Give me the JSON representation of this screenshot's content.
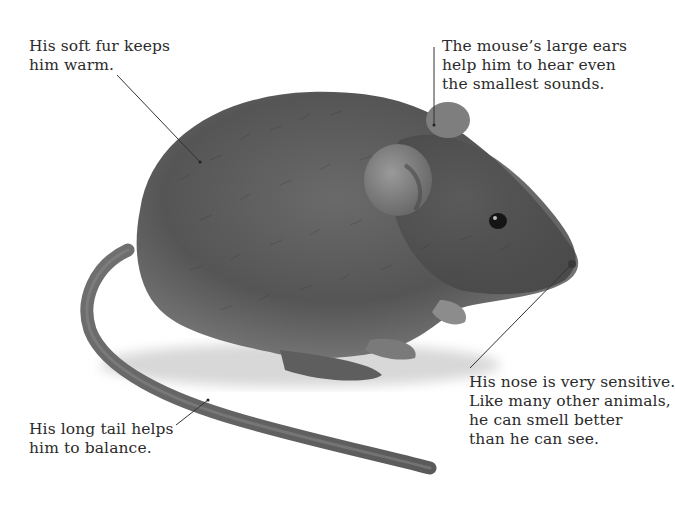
{
  "image": {
    "subject": "mouse",
    "background_color": "#ffffff",
    "fur_color": "#5e5e5e",
    "tail_color": "#6f6f6f",
    "text_color": "#2b2b2b",
    "leader_line_color": "#333333"
  },
  "captions": {
    "fur": {
      "lines": [
        "His soft fur keeps",
        "him warm."
      ]
    },
    "ears": {
      "lines": [
        "The mouse’s large ears",
        "help him to hear even",
        "the smallest sounds."
      ]
    },
    "nose": {
      "lines": [
        "His nose is very sensitive.",
        "Like many other animals,",
        "he can smell better",
        "than he can see."
      ]
    },
    "tail": {
      "lines": [
        "His long tail helps",
        "him to balance."
      ]
    }
  }
}
